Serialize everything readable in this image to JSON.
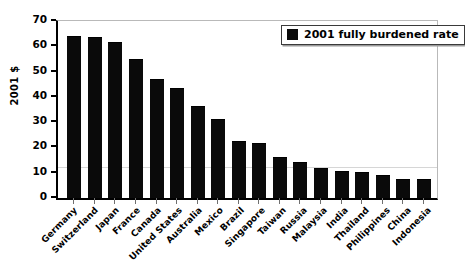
{
  "chart_data": {
    "type": "bar",
    "title": "",
    "xlabel": "",
    "ylabel": "2001 $",
    "ylim": [
      0,
      70
    ],
    "yticks": [
      70,
      60,
      50,
      40,
      30,
      20,
      10,
      0
    ],
    "grid": false,
    "legend_position": "top-right",
    "legend": [
      "2001 fully burdened rate"
    ],
    "categories": [
      "Germany",
      "Switzerland",
      "Japan",
      "France",
      "Canada",
      "United States",
      "Australia",
      "Mexico",
      "Brazil",
      "Singapore",
      "Taiwan",
      "Russia",
      "Malaysia",
      "India",
      "Thailand",
      "Philippines",
      "China",
      "Indonesia"
    ],
    "values": [
      63.5,
      63.3,
      61.5,
      54.5,
      46.8,
      43.2,
      36.0,
      30.8,
      22.2,
      21.5,
      15.8,
      13.8,
      11.3,
      10.4,
      9.8,
      8.8,
      7.3,
      7.2
    ],
    "series": [
      {
        "name": "2001 fully burdened rate",
        "color": "#0a0a0a",
        "values": [
          63.5,
          63.3,
          61.5,
          54.5,
          46.8,
          43.2,
          36.0,
          30.8,
          22.2,
          21.5,
          15.8,
          13.8,
          11.3,
          10.4,
          9.8,
          8.8,
          7.3,
          7.2
        ]
      }
    ],
    "annotations": {
      "soft_gridline_value": 12.2
    }
  },
  "legend": {
    "label": "2001 fully burdened rate"
  },
  "axes": {
    "y_title": "2001 $"
  }
}
